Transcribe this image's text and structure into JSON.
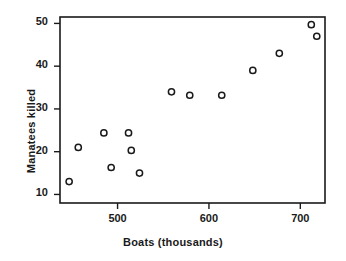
{
  "chart_data": {
    "type": "scatter",
    "title": "",
    "xlabel": "Boats (thousands)",
    "ylabel": "Manatees killed",
    "xlim": [
      437,
      727
    ],
    "ylim": [
      8.0,
      51.5
    ],
    "xticks": [
      500,
      600,
      700
    ],
    "yticks": [
      10,
      20,
      30,
      40,
      50
    ],
    "xtick_labels": [
      "500",
      "600",
      "700"
    ],
    "ytick_labels": [
      "10",
      "20",
      "30",
      "40",
      "50"
    ],
    "grid": false,
    "legend": false,
    "marker": "open-circle",
    "marker_color": "#1a1a1a",
    "marker_fill": "#ffffff",
    "frame_color": "#1a1a1a",
    "background": "#ffffff",
    "x": [
      447,
      457,
      485,
      493,
      512,
      515,
      524,
      559,
      579,
      614,
      648,
      677,
      712,
      718
    ],
    "y": [
      13.0,
      21.0,
      24.4,
      16.3,
      24.4,
      20.3,
      15.0,
      34.0,
      33.2,
      33.2,
      39.0,
      43.0,
      49.7,
      47.0
    ],
    "points": [
      {
        "x": 447,
        "y": 13.0
      },
      {
        "x": 457,
        "y": 21.0
      },
      {
        "x": 485,
        "y": 24.4
      },
      {
        "x": 493,
        "y": 16.3
      },
      {
        "x": 512,
        "y": 24.4
      },
      {
        "x": 515,
        "y": 20.3
      },
      {
        "x": 524,
        "y": 15.0
      },
      {
        "x": 559,
        "y": 34.0
      },
      {
        "x": 579,
        "y": 33.2
      },
      {
        "x": 614,
        "y": 33.2
      },
      {
        "x": 648,
        "y": 39.0
      },
      {
        "x": 677,
        "y": 43.0
      },
      {
        "x": 712,
        "y": 49.7
      },
      {
        "x": 718,
        "y": 47.0
      }
    ]
  },
  "labels": {
    "xlabel": "Boats (thousands)",
    "ylabel": "Manatees killed"
  }
}
